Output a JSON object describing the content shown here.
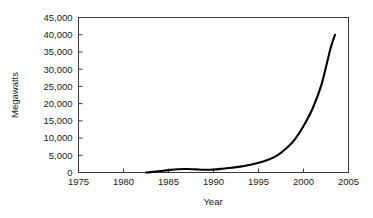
{
  "chart_data": {
    "type": "line",
    "title": "",
    "subtitle": "",
    "xlabel": "Year",
    "ylabel": "Megawatts",
    "xlim": [
      1975,
      2005
    ],
    "ylim": [
      0,
      45000
    ],
    "grid": false,
    "legend": null,
    "x_ticks": [
      1975,
      1980,
      1985,
      1990,
      1995,
      2000,
      2005
    ],
    "x_tick_labels": [
      "1975",
      "1980",
      "1985",
      "1990",
      "1995",
      "2000",
      "2005"
    ],
    "y_ticks": [
      0,
      5000,
      10000,
      15000,
      20000,
      25000,
      30000,
      35000,
      40000,
      45000
    ],
    "y_tick_labels": [
      "0",
      "5,000",
      "10,000",
      "15,000",
      "20,000",
      "25,000",
      "30,000",
      "35,000",
      "40,000",
      "45,000"
    ],
    "line_color": "#000000",
    "axis_color": "#3a3a3a",
    "background_color": "#ffffff",
    "series": [
      {
        "name": "Installed capacity",
        "x": [
          1982.5,
          1983,
          1984,
          1985,
          1986,
          1987,
          1988,
          1989,
          1990,
          1991,
          1992,
          1993,
          1994,
          1995,
          1996,
          1997,
          1998,
          1999,
          2000,
          2001,
          2002,
          2003,
          2003.5
        ],
        "values": [
          0,
          120,
          400,
          700,
          950,
          1000,
          900,
          800,
          850,
          1100,
          1400,
          1700,
          2200,
          2800,
          3600,
          4800,
          6800,
          9500,
          13500,
          18500,
          25500,
          36000,
          40000
        ]
      }
    ]
  },
  "axis": {
    "ylabel": "Megawatts",
    "xlabel": "Year"
  }
}
